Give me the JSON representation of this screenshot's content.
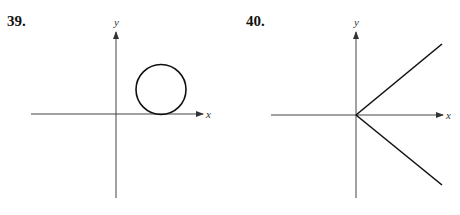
{
  "problems": [
    {
      "number": "39.",
      "x_label": "x",
      "y_label": "y",
      "description": "Circle in the first quadrant tangent to the x-axis"
    },
    {
      "number": "40.",
      "x_label": "x",
      "y_label": "y",
      "description": "Two rays from the origin, one into the first quadrant and one into the fourth quadrant, symmetric about the x-axis"
    }
  ],
  "colors": {
    "stroke": "#111111",
    "axis": "#333333",
    "background": "#ffffff"
  }
}
